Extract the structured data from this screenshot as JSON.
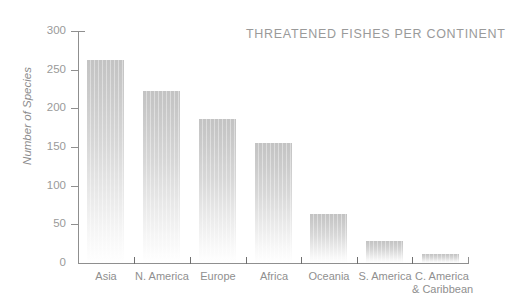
{
  "chart_data": {
    "type": "bar",
    "title": "THREATENED FISHES PER CONTINENT",
    "xlabel": "",
    "ylabel": "Number of Species",
    "categories": [
      "Asia",
      "N. America",
      "Europe",
      "Africa",
      "Oceania",
      "S. America",
      "C. America\n& Caribbean"
    ],
    "values": [
      262,
      223,
      186,
      155,
      64,
      29,
      12
    ],
    "ylim": [
      0,
      300
    ],
    "yticks": [
      0,
      50,
      100,
      150,
      200,
      250,
      300
    ],
    "ytick_labels": [
      "0",
      "50",
      "100",
      "150",
      "200",
      "250",
      "300"
    ],
    "grid": false,
    "legend": false,
    "bar_color_top": "#c3c3c3",
    "bar_color_bottom": "#ffffff",
    "axis_color": "#8f8f8f",
    "text_color": "#8f8f8f"
  },
  "labels": {
    "cat0": "Asia",
    "cat1": "N. America",
    "cat2": "Europe",
    "cat3": "Africa",
    "cat4": "Oceania",
    "cat5": "S. America",
    "cat6_line1": "C. America",
    "cat6_line2": "& Caribbean"
  },
  "ytick_labels": {
    "t0": "0",
    "t1": "50",
    "t2": "100",
    "t3": "150",
    "t4": "200",
    "t5": "250",
    "t6": "300"
  }
}
